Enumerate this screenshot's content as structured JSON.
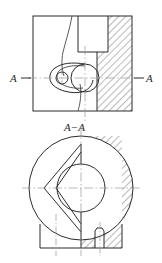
{
  "drawing": {
    "type": "engineering-drawing",
    "title_label": "A−A",
    "section_marker_left": "A−",
    "section_marker_right": "−A",
    "section_letter": "A",
    "colors": {
      "outline": "#2b2b2b",
      "hatch": "#3a3a3a",
      "centerline": "#9a9a9a",
      "background": "#ffffff"
    },
    "views": [
      {
        "name": "top-view",
        "description": "Plan view of valve body with cam lever, pivot bore and hatched wall section",
        "outer_rect": {
          "x": 33,
          "y": 16,
          "width": 99,
          "height": 95
        },
        "features": [
          {
            "name": "main-bore-circle",
            "cx": 85,
            "cy": 78,
            "r": 14
          },
          {
            "name": "pivot-bore-circle",
            "cx": 62,
            "cy": 78,
            "r": 6
          },
          {
            "name": "cam-lever-outline",
            "type": "teardrop"
          },
          {
            "name": "upper-chamber-rect",
            "x": 78,
            "y": 16,
            "width": 42,
            "height": 36
          },
          {
            "name": "hatched-wall",
            "x": 108,
            "y": 16,
            "width": 24,
            "height": 95
          },
          {
            "name": "hatched-lower-wall",
            "x": 97,
            "y": 52,
            "width": 35,
            "height": 59
          },
          {
            "name": "profile-curve",
            "description": "free-form internal passage profile"
          }
        ],
        "centerlines": [
          {
            "name": "horizontal-centerline",
            "y": 78
          },
          {
            "name": "vertical-centerline",
            "x": 85
          }
        ]
      },
      {
        "name": "section-view-aa",
        "description": "Section A-A: circular body with V-shaped cam slot, central bore, hatched right half and base flange with keyway",
        "outer_circle": {
          "cx": 81,
          "cy": 188,
          "r": 52
        },
        "features": [
          {
            "name": "central-bore-circle",
            "cx": 81,
            "cy": 188,
            "r": 24
          },
          {
            "name": "v-slot-cutout",
            "type": "triangular-arrow"
          },
          {
            "name": "hatched-right-half"
          },
          {
            "name": "base-flange",
            "x": 40,
            "y": 224,
            "width": 82,
            "height": 24
          },
          {
            "name": "keyway-notch",
            "x": 95,
            "y": 228,
            "width": 9,
            "height": 14
          }
        ],
        "centerlines": [
          {
            "name": "horizontal-centerline",
            "y": 188
          },
          {
            "name": "vertical-centerline",
            "x": 81
          },
          {
            "name": "keyway-centerline",
            "x": 100
          },
          {
            "name": "left-base-centerline",
            "x": 56
          }
        ]
      }
    ]
  }
}
